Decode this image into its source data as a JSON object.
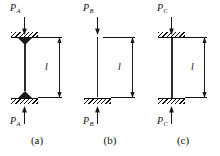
{
  "figure": {
    "ink_color": "#1a1a1a",
    "background": "#ffffff"
  },
  "panels": [
    {
      "id": "a",
      "caption": "(a)",
      "load_symbol": "P",
      "load_subscript": "A",
      "length_label": "l",
      "top_support": "pinned",
      "bottom_support": "pinned",
      "top_arrow": "down",
      "bottom_arrow": "up"
    },
    {
      "id": "b",
      "caption": "(b)",
      "load_symbol": "P",
      "load_subscript": "B",
      "length_label": "l",
      "top_support": "free",
      "bottom_support": "fixed",
      "top_arrow": "down",
      "bottom_arrow": "up"
    },
    {
      "id": "c",
      "caption": "(c)",
      "load_symbol": "P",
      "load_subscript": "C",
      "length_label": "l",
      "top_support": "fixed",
      "bottom_support": "fixed",
      "top_arrow": "down",
      "bottom_arrow": "up"
    }
  ]
}
